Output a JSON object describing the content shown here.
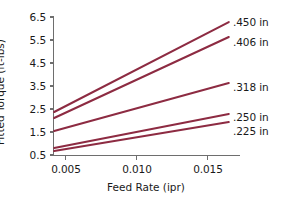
{
  "chart_data": {
    "type": "line",
    "title": "",
    "xlabel": "Feed Rate (ipr)",
    "ylabel": "Fitted Torque (ft-lbs)",
    "xlim": [
      0.0042,
      0.0165
    ],
    "ylim": [
      0.5,
      6.5
    ],
    "grid": false,
    "legend_position": "right-inline",
    "xticks": [
      0.005,
      0.01,
      0.015
    ],
    "xtick_labels": [
      "0.005",
      "0.010",
      "0.015"
    ],
    "yticks": [
      0.5,
      1.5,
      2.5,
      3.5,
      4.5,
      5.5,
      6.5
    ],
    "ytick_labels": [
      "0.5",
      "1.5",
      "2.5",
      "3.5",
      "4.5",
      "5.5",
      "6.5"
    ],
    "line_color": "#8d2b42",
    "axis_color": "#6e6e6e",
    "series": [
      {
        "name": ".450 in",
        "label": ".450 in",
        "x": [
          0.0042,
          0.0165
        ],
        "values": [
          2.37,
          6.28
        ]
      },
      {
        "name": ".406 in",
        "label": ".406 in",
        "x": [
          0.0042,
          0.0165
        ],
        "values": [
          2.11,
          5.63
        ]
      },
      {
        "name": ".318 in",
        "label": ".318 in",
        "x": [
          0.0042,
          0.0165
        ],
        "values": [
          1.54,
          3.63
        ]
      },
      {
        "name": ".250 in",
        "label": ".250 in",
        "x": [
          0.0042,
          0.0165
        ],
        "values": [
          0.8,
          2.28
        ]
      },
      {
        "name": ".225 in",
        "label": ".225 in",
        "x": [
          0.0042,
          0.0165
        ],
        "values": [
          0.67,
          1.93
        ]
      }
    ]
  }
}
